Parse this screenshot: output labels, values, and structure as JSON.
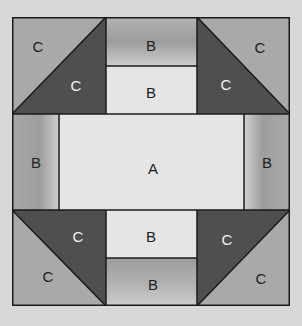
{
  "diagram": {
    "type": "quilt-block",
    "colors": {
      "background": "#d8d8d8",
      "outline": "#1a1a1a",
      "c_medium": "#a9a9a9",
      "c_dark": "#4f4f4f",
      "light_patch": "#e5e5e5",
      "b_shaded_dark": "#9c9c9c",
      "b_shaded_light": "#cdcdcd"
    },
    "pieces": {
      "top_left_outer": "C",
      "top_left_inner": "C",
      "top_outer": "B",
      "top_inner": "B",
      "top_right_outer": "C",
      "top_right_inner": "C",
      "left": "B",
      "center": "A",
      "right": "B",
      "bottom_left_inner": "C",
      "bottom_left_outer": "C",
      "bottom_inner": "B",
      "bottom_outer": "B",
      "bottom_right_inner": "C",
      "bottom_right_outer": "C"
    }
  }
}
